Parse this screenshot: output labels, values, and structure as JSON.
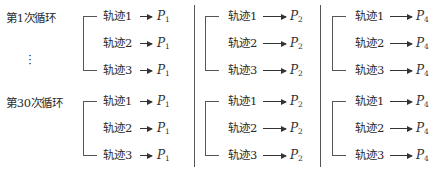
{
  "loops": [
    {
      "label": "第1次循环",
      "y": 16
    },
    {
      "label": "第30次循环",
      "y": 101
    }
  ],
  "ellipsis": "⋮",
  "columns": [
    {
      "bracket_x": 83,
      "label_x": 103,
      "arrow_x1": 140,
      "arrow_x2": 152,
      "p_x": 157,
      "p_base": "P",
      "p_sub": "1"
    },
    {
      "bracket_x": 205,
      "label_x": 228,
      "arrow_x1": 263,
      "arrow_x2": 286,
      "p_x": 290,
      "p_base": "P",
      "p_sub": "2"
    },
    {
      "bracket_x": 332,
      "label_x": 355,
      "arrow_x1": 390,
      "arrow_x2": 412,
      "p_x": 416,
      "p_base": "P",
      "p_sub": "4"
    }
  ],
  "separators_x": [
    194,
    320
  ],
  "trajectories": [
    "轨迹1",
    "轨迹2",
    "轨迹3"
  ],
  "group_rows": [
    [
      16,
      43,
      70
    ],
    [
      101,
      128,
      155
    ]
  ],
  "diagram": {
    "text": {
      "loop_1": "第1次循环",
      "loop_30": "第30次循环",
      "traj_1": "轨迹1",
      "traj_2": "轨迹2",
      "traj_3": "轨迹3",
      "p1": "1",
      "p2": "2",
      "p4": "4",
      "p": "P",
      "ellipsis": "⋮"
    }
  }
}
